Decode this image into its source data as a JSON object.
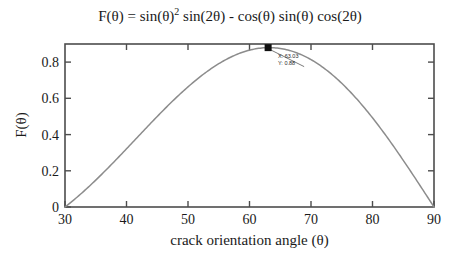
{
  "chart_data": {
    "type": "line",
    "title": "F(θ) = sin(θ)2 sin(2θ) - cos(θ) sin(θ) cos(2θ)",
    "title_parts": {
      "lead": "F(θ) = sin(θ)",
      "exponent": "2",
      "tail": " sin(2θ) - cos(θ) sin(θ) cos(2θ)"
    },
    "xlabel": "crack orientation angle (θ)",
    "ylabel": "F(θ)",
    "xlim": [
      30,
      90
    ],
    "ylim": [
      0,
      0.9
    ],
    "xticks": [
      30,
      40,
      50,
      60,
      70,
      80,
      90
    ],
    "xtick_labels": [
      "30",
      "40",
      "50",
      "60",
      "70",
      "80",
      "90"
    ],
    "yticks": [
      0,
      0.2,
      0.4,
      0.6,
      0.8
    ],
    "ytick_labels": [
      "0",
      "0.2",
      "0.4",
      "0.6",
      "0.8"
    ],
    "grid": false,
    "legend": false,
    "line_color": "#8c8c8c",
    "marker_color": "#111111",
    "axis_color": "#4d4d4d",
    "x": [
      30,
      31,
      32,
      33,
      34,
      35,
      36,
      37,
      38,
      39,
      40,
      41,
      42,
      43,
      44,
      45,
      46,
      47,
      48,
      49,
      50,
      51,
      52,
      53,
      54,
      55,
      56,
      57,
      58,
      59,
      60,
      61,
      62,
      63,
      63.03,
      64,
      65,
      66,
      67,
      68,
      69,
      70,
      71,
      72,
      73,
      74,
      75,
      76,
      77,
      78,
      79,
      80,
      81,
      82,
      83,
      84,
      85,
      86,
      87,
      88,
      89,
      90
    ],
    "y": [
      0.0,
      0.0374,
      0.0748,
      0.1119,
      0.1487,
      0.1851,
      0.2208,
      0.2558,
      0.29,
      0.3232,
      0.3554,
      0.3864,
      0.4162,
      0.4446,
      0.4716,
      0.4971,
      0.521,
      0.5433,
      0.5638,
      0.5826,
      0.5996,
      0.6147,
      0.6279,
      0.6391,
      0.6484,
      0.6556,
      0.6608,
      0.6639,
      0.665,
      0.664,
      0.6609,
      0.6557,
      0.6485,
      0.6392,
      0.88,
      0.628,
      0.6148,
      0.5997,
      0.5827,
      0.5639,
      0.5434,
      0.5211,
      0.4972,
      0.4717,
      0.4447,
      0.4163,
      0.3865,
      0.3555,
      0.3233,
      0.2901,
      0.2559,
      0.2209,
      0.1852,
      0.1488,
      0.112,
      0.0749,
      0.0375,
      0.0,
      0.0,
      0.0,
      0.0,
      0.0
    ],
    "data_cursor": {
      "x_label": "X: 63.03",
      "y_label": "Y: 0.88",
      "x_value": 63.03,
      "y_value": 0.88,
      "marker": "square"
    }
  }
}
